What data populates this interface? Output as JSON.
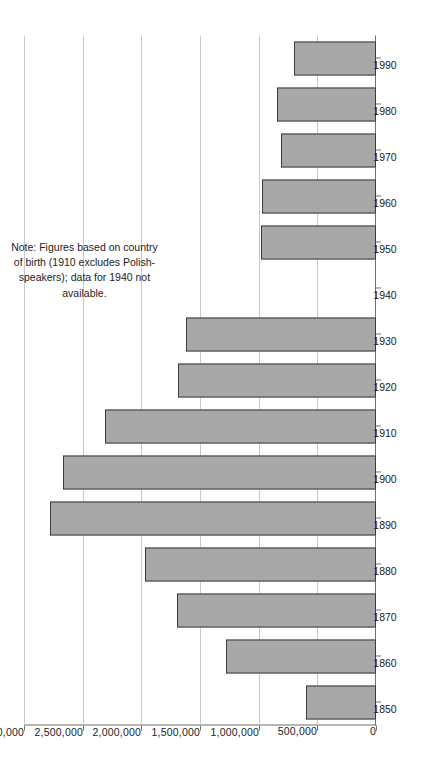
{
  "chart_data": {
    "type": "bar",
    "orientation": "horizontal-rotated",
    "title": "",
    "xlabel": "",
    "ylabel": "",
    "categories": [
      "1850",
      "1860",
      "1870",
      "1880",
      "1890",
      "1900",
      "1910",
      "1920",
      "1930",
      "1940",
      "1950",
      "1960",
      "1970",
      "1980",
      "1990"
    ],
    "values": [
      600000,
      1275000,
      1700000,
      1970000,
      2780000,
      2670000,
      2310000,
      1690000,
      1620000,
      null,
      980000,
      975000,
      810000,
      845000,
      700000
    ],
    "value_axis": {
      "min": 0,
      "max": 3000000,
      "tick_values": [
        0,
        500000,
        1000000,
        1500000,
        2000000,
        2500000,
        3000000
      ],
      "tick_labels": [
        "0",
        "500,000",
        "1,000,000",
        "1,500,000",
        "2,000,000",
        "2,500,000",
        "3,000,000"
      ]
    },
    "grid": true,
    "legend": "none",
    "missing_categories": [
      "1940"
    ],
    "annotations": [
      "Note: Figures based on country of birth (1910 excludes Polish-speakers); data for 1940 not available."
    ],
    "colors": {
      "bar_fill": "#a8a8a8",
      "bar_border": "#3b3b3b",
      "gridline": "#c9c9c9",
      "axis": "#6e6e6e",
      "text": "#222222",
      "background": "#ffffff"
    }
  },
  "note": {
    "text": "Note: Figures based on country of birth (1910 excludes Polish-speakers); data for 1940 not available."
  }
}
